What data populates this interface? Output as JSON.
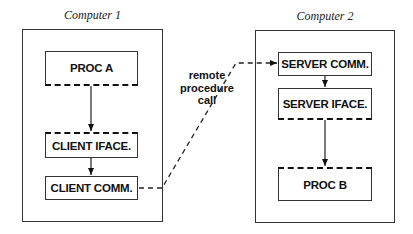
{
  "computers": [
    {
      "label": "Computer 1",
      "nodes": [
        {
          "label": "PROC A"
        },
        {
          "label": "CLIENT IFACE."
        },
        {
          "label": "CLIENT COMM."
        }
      ]
    },
    {
      "label": "Computer 2",
      "nodes": [
        {
          "label": "SERVER COMM."
        },
        {
          "label": "SERVER IFACE."
        },
        {
          "label": "PROC B"
        }
      ]
    }
  ],
  "connection": {
    "line1": "remote",
    "line2": "procedure",
    "line3": "call"
  },
  "colors": {
    "stroke": "#333333",
    "background": "#ffffff"
  }
}
